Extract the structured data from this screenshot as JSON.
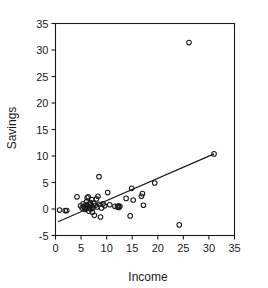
{
  "chart_data": {
    "type": "scatter",
    "title": "",
    "xlabel": "Income",
    "ylabel": "Savings",
    "xlim": [
      0,
      35
    ],
    "ylim": [
      -5,
      35
    ],
    "xticks": [
      0,
      5,
      10,
      15,
      20,
      25,
      30,
      35
    ],
    "yticks": [
      -5,
      0,
      5,
      10,
      15,
      20,
      25,
      30,
      35
    ],
    "xtick_labels": [
      "0",
      "5",
      "10",
      "15",
      "20",
      "25",
      "30",
      "35"
    ],
    "ytick_labels": [
      "-5",
      "0",
      "5",
      "10",
      "15",
      "20",
      "25",
      "30",
      "35"
    ],
    "grid": false,
    "legend": null,
    "marker": "open-circle",
    "marker_color": "#1a1a1a",
    "frame": "box",
    "points": [
      [
        0.8,
        -0.2
      ],
      [
        1.9,
        -0.3
      ],
      [
        2.2,
        -0.3
      ],
      [
        4.2,
        2.3
      ],
      [
        4.9,
        0.6
      ],
      [
        5.2,
        0.2
      ],
      [
        5.4,
        1.0
      ],
      [
        5.6,
        0.4
      ],
      [
        5.8,
        -0.1
      ],
      [
        5.9,
        0.8
      ],
      [
        6.0,
        0.1
      ],
      [
        6.1,
        1.4
      ],
      [
        6.2,
        2.1
      ],
      [
        6.3,
        0.5
      ],
      [
        6.4,
        2.3
      ],
      [
        6.5,
        -0.4
      ],
      [
        6.6,
        0.9
      ],
      [
        6.7,
        0.2
      ],
      [
        6.8,
        1.2
      ],
      [
        6.9,
        0.0
      ],
      [
        7.0,
        0.6
      ],
      [
        7.1,
        1.8
      ],
      [
        7.2,
        -0.6
      ],
      [
        7.3,
        0.3
      ],
      [
        7.5,
        1.1
      ],
      [
        7.6,
        -1.2
      ],
      [
        7.8,
        0.7
      ],
      [
        8.0,
        1.9
      ],
      [
        8.1,
        0.4
      ],
      [
        8.3,
        2.4
      ],
      [
        8.5,
        6.1
      ],
      [
        8.6,
        0.9
      ],
      [
        8.8,
        -1.5
      ],
      [
        9.0,
        0.2
      ],
      [
        9.3,
        1.0
      ],
      [
        9.6,
        0.6
      ],
      [
        10.2,
        3.1
      ],
      [
        10.6,
        0.8
      ],
      [
        11.6,
        0.5
      ],
      [
        12.1,
        0.4
      ],
      [
        12.3,
        0.6
      ],
      [
        12.4,
        0.3
      ],
      [
        12.6,
        0.5
      ],
      [
        13.8,
        2.0
      ],
      [
        14.6,
        -1.3
      ],
      [
        14.9,
        3.9
      ],
      [
        15.2,
        1.7
      ],
      [
        16.8,
        2.4
      ],
      [
        17.0,
        2.9
      ],
      [
        17.2,
        0.7
      ],
      [
        19.4,
        4.9
      ],
      [
        24.2,
        -3.0
      ],
      [
        26.1,
        31.4
      ],
      [
        31.0,
        10.4
      ]
    ],
    "fit_line": {
      "type": "linear-regression",
      "x_start": 0.5,
      "y_start": -2.4,
      "x_end": 31.0,
      "y_end": 10.4
    }
  }
}
